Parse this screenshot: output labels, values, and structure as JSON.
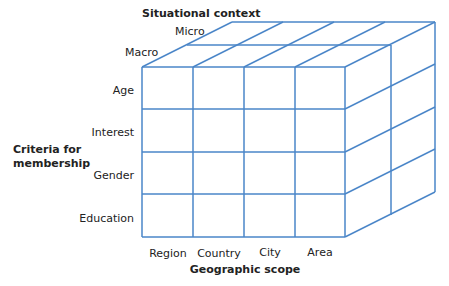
{
  "diagram": {
    "type": "3d-cube-segmentation-matrix",
    "line_color": "#4a86c8",
    "axes": {
      "vertical": {
        "title_line1": "Criteria for",
        "title_line2": "membership",
        "labels": [
          "Age",
          "Interest",
          "Gender",
          "Education"
        ]
      },
      "horizontal": {
        "title": "Geographic scope",
        "labels": [
          "Region",
          "Country",
          "City",
          "Area"
        ]
      },
      "depth": {
        "title": "Situational context",
        "labels": [
          "Macro",
          "Micro"
        ]
      }
    }
  }
}
